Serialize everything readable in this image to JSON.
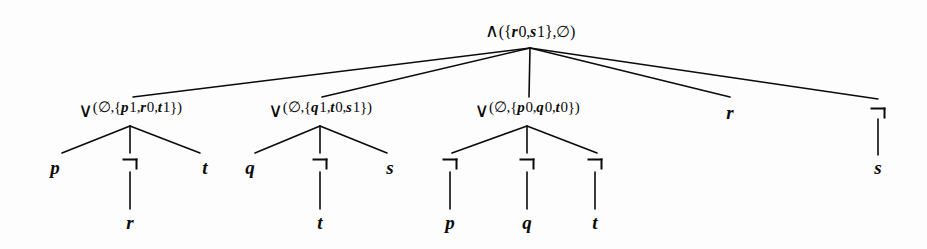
{
  "figure": {
    "kind": "and-or-proof-tree",
    "width": 927,
    "height": 249,
    "background_color": "#fdfdfd",
    "ink_color": "#0b0b0b"
  },
  "glyphs": {
    "and": "∧",
    "or": "∨",
    "not": "¬",
    "empty_set": "∅"
  },
  "nodes": {
    "root": {
      "id": "root",
      "type": "and",
      "glyph": "∧",
      "annotation": "({r0,s1},∅)",
      "label": "∧({r0,s1},∅)",
      "x": 530,
      "y": 30
    },
    "or1": {
      "id": "or1",
      "type": "or",
      "glyph": "∨",
      "annotation": "(∅,{p1,r0,t1})",
      "label": "∨(∅,{p1,r0,t1})",
      "x": 130,
      "y": 110
    },
    "or2": {
      "id": "or2",
      "type": "or",
      "glyph": "∨",
      "annotation": "(∅,{q1,t0,s1})",
      "label": "∨(∅,{q1,t0,s1})",
      "x": 320,
      "y": 110
    },
    "or3": {
      "id": "or3",
      "type": "or",
      "glyph": "∨",
      "annotation": "(∅,{p0,q0,t0})",
      "label": "∨(∅,{p0,q0,t0})",
      "x": 527,
      "y": 110
    },
    "root_leaf_r": {
      "id": "root_leaf_r",
      "type": "leaf",
      "label": "r",
      "x": 730,
      "y": 112
    },
    "root_neg_s": {
      "id": "root_neg_s",
      "type": "not",
      "label": "¬",
      "x": 878,
      "y": 113
    },
    "or1_leaf_p": {
      "id": "or1_leaf_p",
      "type": "leaf",
      "label": "p",
      "x": 55,
      "y": 167
    },
    "or1_neg_r": {
      "id": "or1_neg_r",
      "type": "not",
      "label": "¬",
      "x": 130,
      "y": 164
    },
    "or1_leaf_t": {
      "id": "or1_leaf_t",
      "type": "leaf",
      "label": "t",
      "x": 205,
      "y": 167
    },
    "or2_leaf_q": {
      "id": "or2_leaf_q",
      "type": "leaf",
      "label": "q",
      "x": 250,
      "y": 167
    },
    "or2_neg_t": {
      "id": "or2_neg_t",
      "type": "not",
      "label": "¬",
      "x": 320,
      "y": 164
    },
    "or2_leaf_s": {
      "id": "or2_leaf_s",
      "type": "leaf",
      "label": "s",
      "x": 390,
      "y": 167
    },
    "or3_neg_p": {
      "id": "or3_neg_p",
      "type": "not",
      "label": "¬",
      "x": 450,
      "y": 164
    },
    "or3_neg_q": {
      "id": "or3_neg_q",
      "type": "not",
      "label": "¬",
      "x": 527,
      "y": 164
    },
    "or3_neg_t": {
      "id": "or3_neg_t",
      "type": "not",
      "label": "¬",
      "x": 595,
      "y": 164
    },
    "neg_s_leaf": {
      "id": "neg_s_leaf",
      "type": "leaf",
      "label": "s",
      "x": 878,
      "y": 167
    },
    "negr_leaf_r": {
      "id": "negr_leaf_r",
      "type": "leaf",
      "label": "r",
      "x": 130,
      "y": 222
    },
    "negt_leaf_t": {
      "id": "negt_leaf_t",
      "type": "leaf",
      "label": "t",
      "x": 320,
      "y": 222
    },
    "negp_leaf_p": {
      "id": "negp_leaf_p",
      "type": "leaf",
      "label": "p",
      "x": 450,
      "y": 222
    },
    "negq_leaf_q": {
      "id": "negq_leaf_q",
      "type": "leaf",
      "label": "q",
      "x": 527,
      "y": 222
    },
    "negt2_leaf_t": {
      "id": "negt2_leaf_t",
      "type": "leaf",
      "label": "t",
      "x": 595,
      "y": 222
    }
  },
  "edges": [
    {
      "from": "root",
      "to": "or1",
      "x1": 530,
      "y1": 48,
      "x2": 133,
      "y2": 97
    },
    {
      "from": "root",
      "to": "or2",
      "x1": 530,
      "y1": 48,
      "x2": 322,
      "y2": 97
    },
    {
      "from": "root",
      "to": "or3",
      "x1": 530,
      "y1": 48,
      "x2": 529,
      "y2": 97
    },
    {
      "from": "root",
      "to": "root_leaf_r",
      "x1": 530,
      "y1": 48,
      "x2": 730,
      "y2": 97
    },
    {
      "from": "root",
      "to": "root_neg_s",
      "x1": 530,
      "y1": 48,
      "x2": 878,
      "y2": 99
    },
    {
      "from": "or1",
      "to": "or1_leaf_p",
      "x1": 130,
      "y1": 126,
      "x2": 62,
      "y2": 153
    },
    {
      "from": "or1",
      "to": "or1_neg_r",
      "x1": 130,
      "y1": 126,
      "x2": 130,
      "y2": 153
    },
    {
      "from": "or1",
      "to": "or1_leaf_t",
      "x1": 130,
      "y1": 126,
      "x2": 200,
      "y2": 153
    },
    {
      "from": "or2",
      "to": "or2_leaf_q",
      "x1": 320,
      "y1": 126,
      "x2": 255,
      "y2": 153
    },
    {
      "from": "or2",
      "to": "or2_neg_t",
      "x1": 320,
      "y1": 126,
      "x2": 320,
      "y2": 153
    },
    {
      "from": "or2",
      "to": "or2_leaf_s",
      "x1": 320,
      "y1": 126,
      "x2": 387,
      "y2": 153
    },
    {
      "from": "or3",
      "to": "or3_neg_p",
      "x1": 527,
      "y1": 126,
      "x2": 452,
      "y2": 153
    },
    {
      "from": "or3",
      "to": "or3_neg_q",
      "x1": 527,
      "y1": 126,
      "x2": 527,
      "y2": 153
    },
    {
      "from": "or3",
      "to": "or3_neg_t",
      "x1": 527,
      "y1": 126,
      "x2": 597,
      "y2": 153
    },
    {
      "from": "root_neg_s",
      "to": "neg_s_leaf",
      "x1": 878,
      "y1": 119,
      "x2": 878,
      "y2": 155
    },
    {
      "from": "or1_neg_r",
      "to": "negr_leaf_r",
      "x1": 130,
      "y1": 172,
      "x2": 130,
      "y2": 209
    },
    {
      "from": "or2_neg_t",
      "to": "negt_leaf_t",
      "x1": 320,
      "y1": 172,
      "x2": 320,
      "y2": 209
    },
    {
      "from": "or3_neg_p",
      "to": "negp_leaf_p",
      "x1": 450,
      "y1": 172,
      "x2": 450,
      "y2": 209
    },
    {
      "from": "or3_neg_q",
      "to": "negq_leaf_q",
      "x1": 527,
      "y1": 172,
      "x2": 527,
      "y2": 209
    },
    {
      "from": "or3_neg_t",
      "to": "negt2_leaf_t",
      "x1": 595,
      "y1": 172,
      "x2": 595,
      "y2": 209
    }
  ]
}
